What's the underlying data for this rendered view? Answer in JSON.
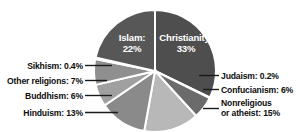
{
  "chart_data": {
    "type": "pie",
    "title": "",
    "subtitle": "",
    "xlabel": "",
    "ylabel": "",
    "legend_position": "callout-labels",
    "grid": false,
    "total_percent": 100,
    "categories": [
      "Christianity",
      "Judaism",
      "Confucianism",
      "Nonreligious or atheist",
      "Hinduism",
      "Buddhism",
      "Other religions",
      "Sikhism",
      "Islam"
    ],
    "values": [
      33,
      0.2,
      6,
      15,
      13,
      6,
      7,
      0.4,
      22
    ],
    "slices": [
      {
        "name": "Christianity",
        "label": "Christianity:",
        "value_text": "33%",
        "value": 33,
        "color": "#4e4e4e",
        "label_placement": "inside"
      },
      {
        "name": "Judaism",
        "label": "Judaism: 0.2%",
        "value_text": "0.2%",
        "value": 0.2,
        "color": "#3f3f3f",
        "label_placement": "right"
      },
      {
        "name": "Confucianism",
        "label": "Confucianism: 6%",
        "value_text": "6%",
        "value": 6,
        "color": "#6b6b6b",
        "label_placement": "right"
      },
      {
        "name": "Nonreligious or atheist",
        "label_line1": "Nonreligious",
        "label_line2": "or atheist: 15%",
        "value_text": "15%",
        "value": 15,
        "color": "#b8b8b8",
        "label_placement": "right"
      },
      {
        "name": "Hinduism",
        "label": "Hinduism: 13%",
        "value_text": "13%",
        "value": 13,
        "color": "#8a8a8a",
        "label_placement": "left"
      },
      {
        "name": "Buddhism",
        "label": "Buddhism: 6%",
        "value_text": "6%",
        "value": 6,
        "color": "#a0a0a0",
        "label_placement": "left"
      },
      {
        "name": "Other religions",
        "label": "Other religions: 7%",
        "value_text": "7%",
        "value": 7,
        "color": "#8f8f8f",
        "label_placement": "left"
      },
      {
        "name": "Sikhism",
        "label": "Sikhism: 0.4%",
        "value_text": "0.4%",
        "value": 0.4,
        "color": "#9a9a9a",
        "label_placement": "left"
      },
      {
        "name": "Islam",
        "label": "Islam:",
        "value_text": "22%",
        "value": 22,
        "color": "#575757",
        "label_placement": "inside"
      }
    ],
    "colors": {
      "background": "#ffffff",
      "slice_border": "#ffffff",
      "label_text": "#0d0d0d",
      "inner_label_text": "#ffffff",
      "leader_line": "#1a1a1a"
    }
  },
  "labels": {
    "christianity_name": "Christianity:",
    "christianity_pct": "33%",
    "islam_name": "Islam:",
    "islam_pct": "22%",
    "judaism": "Judaism: 0.2%",
    "confucianism": "Confucianism: 6%",
    "nonreligious_line1": "Nonreligious",
    "nonreligious_line2": "or atheist: 15%",
    "hinduism": "Hinduism: 13%",
    "buddhism": "Buddhism: 6%",
    "other_religions": "Other religions: 7%",
    "sikhism": "Sikhism: 0.4%"
  }
}
